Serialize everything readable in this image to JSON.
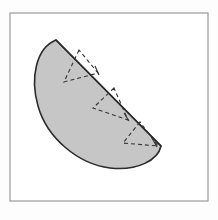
{
  "figure": {
    "title": "Shaded circular segment with inscribed dashed zigzag triangles",
    "caption": "",
    "background_color": "#fdfdfd",
    "frame": {
      "name": "figure-border",
      "x": 10,
      "y": 13,
      "width": 198,
      "height": 188,
      "stroke_color": "#9a9a9a",
      "stroke_width": 1.2,
      "fill_color": "#ffffff"
    },
    "segment": {
      "label": "shaded-region",
      "fill_color": "#c6c6c6",
      "stroke_color": "#2b2b2b",
      "stroke_width": 1.6,
      "description": "Tilted half-disk: curved arc on the lower-left, straight chord on the upper-right",
      "chord_start": [
        56,
        40
      ],
      "chord_end": [
        161,
        146
      ],
      "arc_extreme": [
        42,
        120
      ],
      "path": "M 56 40 C 36 48 30 78 38 106 C 47 138 78 164 110 168 C 138 171 158 160 161 146 Z"
    },
    "chord": {
      "label": "chord-edge",
      "stroke_color": "#2b2b2b",
      "stroke_width": 1.6,
      "x1": 56,
      "y1": 40,
      "x2": 161,
      "y2": 146
    },
    "dash_style": {
      "stroke_color": "#333333",
      "stroke_width": 1.1,
      "dash_pattern": "4 3"
    },
    "triangles": [
      {
        "name": "dashed-triangle-1",
        "vertices": [
          [
            79,
            50
          ],
          [
            64,
            82
          ],
          [
            98,
            73
          ]
        ]
      },
      {
        "name": "dashed-triangle-2",
        "vertices": [
          [
            114,
            88
          ],
          [
            93,
            108
          ],
          [
            128,
            120
          ]
        ]
      },
      {
        "name": "dashed-triangle-3",
        "vertices": [
          [
            140,
            122
          ],
          [
            123,
            143
          ],
          [
            158,
            146
          ]
        ]
      }
    ],
    "tick_marks": [
      {
        "name": "tick-mark-1",
        "x1": 95,
        "y1": 66,
        "x2": 99,
        "y2": 75
      },
      {
        "name": "tick-mark-2",
        "x1": 124,
        "y1": 113,
        "x2": 129,
        "y2": 121
      },
      {
        "name": "tick-mark-3",
        "x1": 152,
        "y1": 138,
        "x2": 157,
        "y2": 147
      }
    ]
  }
}
